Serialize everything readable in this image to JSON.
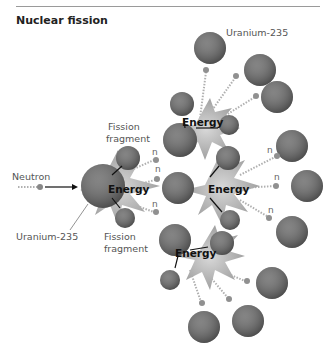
{
  "figure": {
    "title": "Nuclear fission",
    "labels": {
      "neutron": "Neutron",
      "uranium_left": "Uranium-235",
      "uranium_top": "Uranium-235",
      "fission_fragment_top_1": "Fission",
      "fission_fragment_top_2": "fragment",
      "fission_fragment_bottom_1": "Fission",
      "fission_fragment_bottom_2": "fragment",
      "energy": "Energy",
      "neutron_symbol": "n"
    },
    "colors": {
      "atom": "#7a7a7a",
      "burst": "#b5b5b5",
      "text": "#555555"
    }
  }
}
